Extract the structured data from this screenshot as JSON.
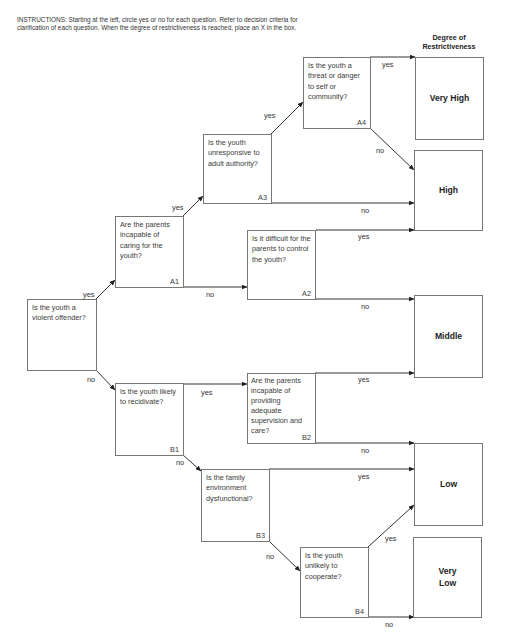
{
  "instructions": "INSTRUCTIONS: Starting at the left, circle yes or no for each question. Refer to decision criteria for clarification of each question. When the degree of restrictiveness is reached, place an X in the box.",
  "header": "Degree of Restrictiveness",
  "questions": {
    "start": {
      "text": "Is the youth a violent offender?",
      "code": ""
    },
    "A1": {
      "text": "Are the parents incapable of caring for the youth?",
      "code": "A1"
    },
    "A2": {
      "text": "Is it difficult for the parents to control the youth?",
      "code": "A2"
    },
    "A3": {
      "text": "Is the youth unresponsive to adult authority?",
      "code": "A3"
    },
    "A4": {
      "text": "Is the youth a threat or danger to self or community?",
      "code": "A4"
    },
    "B1": {
      "text": "Is the youth likely to recidivate?",
      "code": "B1"
    },
    "B2": {
      "text": "Are the parents incapable of providing adequate supervision and care?",
      "code": "B2"
    },
    "B3": {
      "text": "Is the family environment dysfunctional?",
      "code": "B3"
    },
    "B4": {
      "text": "Is the youth unlikely to cooperate?",
      "code": "B4"
    }
  },
  "outcomes": {
    "very_high": "Very High",
    "high": "High",
    "middle": "Middle",
    "low": "Low",
    "very_low": "Very Low"
  },
  "labels": {
    "yes": "yes",
    "no": "no"
  },
  "edges": [
    {
      "from": "start",
      "answer": "yes",
      "to": "A1"
    },
    {
      "from": "start",
      "answer": "no",
      "to": "B1"
    },
    {
      "from": "A1",
      "answer": "yes",
      "to": "A3"
    },
    {
      "from": "A1",
      "answer": "no",
      "to": "A2"
    },
    {
      "from": "A3",
      "answer": "yes",
      "to": "A4"
    },
    {
      "from": "A3",
      "answer": "no",
      "to": "High"
    },
    {
      "from": "A4",
      "answer": "yes",
      "to": "Very High"
    },
    {
      "from": "A4",
      "answer": "no",
      "to": "High"
    },
    {
      "from": "A2",
      "answer": "yes",
      "to": "High"
    },
    {
      "from": "A2",
      "answer": "no",
      "to": "Middle"
    },
    {
      "from": "B1",
      "answer": "yes",
      "to": "B2"
    },
    {
      "from": "B1",
      "answer": "no",
      "to": "B3"
    },
    {
      "from": "B2",
      "answer": "yes",
      "to": "Middle"
    },
    {
      "from": "B2",
      "answer": "no",
      "to": "Low"
    },
    {
      "from": "B3",
      "answer": "yes",
      "to": "Low"
    },
    {
      "from": "B3",
      "answer": "no",
      "to": "B4"
    },
    {
      "from": "B4",
      "answer": "yes",
      "to": "Low"
    },
    {
      "from": "B4",
      "answer": "no",
      "to": "Very Low"
    }
  ]
}
